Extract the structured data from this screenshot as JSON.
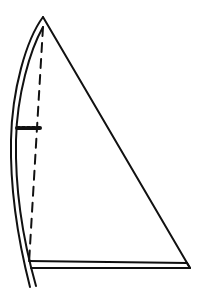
{
  "diagram": {
    "title": "",
    "colors": {
      "background": "#ffffff",
      "ink": "#111111"
    },
    "canvas": {
      "width": 203,
      "height": 299
    },
    "parts": {
      "mast_outer": {
        "path": "M43 17 C 26 40, 12 90, 11 140 C 10 190, 18 240, 30 287"
      },
      "mast_inner": {
        "path": "M43 27 C 30 50, 17 95, 16 140 C 15 190, 23 240, 36 286"
      },
      "luff_dashed": {
        "x1": 43,
        "y1": 27,
        "x2": 29,
        "y2": 263,
        "dash": "9 7"
      },
      "leech": {
        "x1": 43,
        "y1": 17,
        "x2": 190,
        "y2": 268
      },
      "boom_top": {
        "x1": 29,
        "y1": 261,
        "x2": 187,
        "y2": 263
      },
      "boom_bottom": {
        "x1": 31,
        "y1": 268,
        "x2": 190,
        "y2": 268
      },
      "boom_end": {
        "x1": 187,
        "y1": 263,
        "x2": 190,
        "y2": 268
      },
      "reef_mark": {
        "x1": 17,
        "y1": 128,
        "x2": 40,
        "y2": 128,
        "dash": "3 2"
      }
    }
  }
}
